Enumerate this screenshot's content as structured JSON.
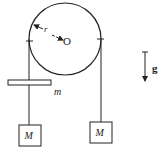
{
  "diagram": {
    "pulley": {
      "center_label": "O",
      "radius_label": "r"
    },
    "bar": {
      "label": "m"
    },
    "left_mass": {
      "label": "M"
    },
    "right_mass": {
      "label": "M"
    },
    "gravity": {
      "label": "g"
    },
    "colors": {
      "stroke": "#222222",
      "background": "#ffffff"
    }
  }
}
